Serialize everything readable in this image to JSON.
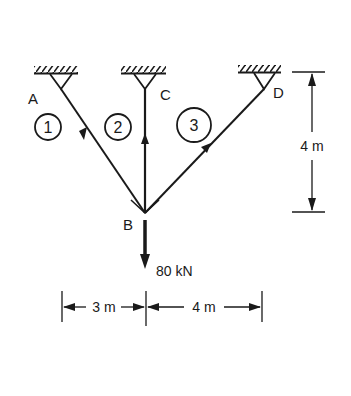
{
  "diagram": {
    "type": "truss",
    "nodes": {
      "A": {
        "label": "A"
      },
      "B": {
        "label": "B"
      },
      "C": {
        "label": "C"
      },
      "D": {
        "label": "D"
      }
    },
    "members": [
      {
        "id": "1",
        "label": "1",
        "from": "B",
        "to": "A"
      },
      {
        "id": "2",
        "label": "2",
        "from": "B",
        "to": "C"
      },
      {
        "id": "3",
        "label": "3",
        "from": "B",
        "to": "D"
      }
    ],
    "load": {
      "label": "80 kN",
      "at": "B",
      "direction": "down"
    },
    "dimensions": {
      "height": "4 m",
      "left_span": "3 m",
      "right_span": "4 m"
    },
    "colors": {
      "ink": "#1a1a1a",
      "background": "#ffffff"
    }
  }
}
